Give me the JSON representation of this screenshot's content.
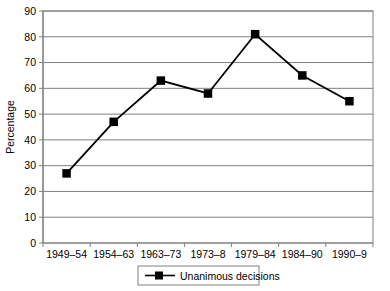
{
  "chart_data": {
    "type": "line",
    "title": "",
    "xlabel": "",
    "ylabel": "Percentage",
    "categories": [
      "1949–54",
      "1954–63",
      "1963–73",
      "1973–8",
      "1979–84",
      "1984–90",
      "1990–9"
    ],
    "series": [
      {
        "name": "Unanimous decisions",
        "values": [
          27,
          47,
          63,
          58,
          81,
          65,
          55
        ],
        "marker": "square",
        "color": "#000000"
      }
    ],
    "ylim": [
      0,
      90
    ],
    "yticks": [
      0,
      10,
      20,
      30,
      40,
      50,
      60,
      70,
      80,
      90
    ],
    "ytick_labels": [
      "0",
      "10",
      "20",
      "30",
      "40",
      "50",
      "60",
      "70",
      "80",
      "90"
    ],
    "grid": "horizontal",
    "grid_color": "#808080",
    "frame_color": "#808080",
    "legend_position": "bottom-center",
    "legend_entries": [
      "Unanimous decisions"
    ]
  },
  "axes": {
    "y_title": "Percentage"
  },
  "legend": {
    "entry_label": "Unanimous decisions",
    "marker_icon": "square-marker-icon",
    "line_icon": "line-sample-icon"
  }
}
